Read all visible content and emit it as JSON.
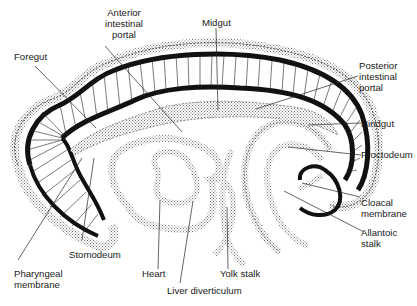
{
  "diagram": {
    "colors": {
      "background": "#ffffff",
      "ink": "#111111",
      "stipple": "#9a9a9a"
    },
    "labels": {
      "anterior_intestinal_portal": "Anterior\nintestinal\nportal",
      "midgut": "Midgut",
      "foregut": "Foregut",
      "posterior_intestinal_portal": "Posterior\nintestinal\nportal",
      "hindgut": "Hindgut",
      "proctodeum": "Proctodeum",
      "cloacal_membrane": "Cloacal\nmembrane",
      "allantoic_stalk": "Allantoic\nstalk",
      "stomodeum": "Stomodeum",
      "pharyngeal_membrane": "Pharyngeal\nmembrane",
      "heart": "Heart",
      "yolk_stalk": "Yolk stalk",
      "liver_diverticulum": "Liver diverticulum"
    }
  }
}
